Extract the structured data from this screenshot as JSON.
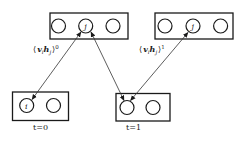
{
  "diagram": {
    "type": "rbm-contrastive-divergence",
    "layers": {
      "hidden_t0": {
        "nodes": [
          "",
          "j",
          ""
        ],
        "role": "hidden"
      },
      "hidden_t1": {
        "nodes": [
          "",
          "j",
          ""
        ],
        "role": "hidden"
      },
      "visible_t0": {
        "nodes": [
          "i",
          ""
        ],
        "role": "visible",
        "caption": "t=0"
      },
      "visible_t1": {
        "nodes": [
          "",
          ""
        ],
        "role": "visible",
        "caption": "t=1"
      }
    },
    "labels": {
      "corr0": {
        "open": "⟨",
        "v": "v",
        "i": "i",
        "h": "h",
        "j": "j",
        "close": "⟩",
        "sup": "0"
      },
      "corr1": {
        "open": "⟨",
        "v": "v",
        "i": "i",
        "h": "h",
        "j": "j",
        "close": "⟩",
        "sup": "1"
      }
    },
    "edges": [
      {
        "from": "visible_t0.i",
        "to": "hidden_t0.j",
        "arrows": "both"
      },
      {
        "from": "hidden_t0.j",
        "to": "visible_t1.0",
        "arrows": "both"
      },
      {
        "from": "hidden_t1.j",
        "to": "visible_t1.0",
        "arrows": "both"
      }
    ]
  }
}
